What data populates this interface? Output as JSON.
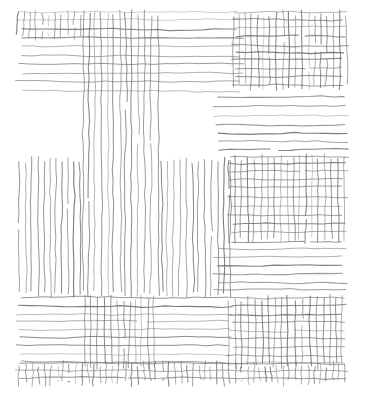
{
  "artwork": {
    "title": "Hatched Bands Drawing",
    "medium": "pen hatching",
    "canvas": {
      "width": 372,
      "height": 404,
      "background": "#ffffff"
    },
    "stroke": {
      "color": "#6f6f6f",
      "color_light": "#8d8d8d",
      "color_dark": "#5a5a5a",
      "width": 0.85,
      "jitter": 0.9
    },
    "composition": {
      "drawing_bounds": {
        "x": 16,
        "y": 11,
        "width": 332,
        "height": 374
      },
      "spacing": {
        "horizontal": 8.2,
        "vertical": 6.4
      }
    },
    "bands": [
      {
        "name": "top-horizontal-left-wide",
        "orientation": "horizontal",
        "x": 17,
        "y": 11,
        "width": 225,
        "height": 80,
        "density": 8.3,
        "tone": "#6f6f6f"
      },
      {
        "name": "top-horizontal-right-upper",
        "orientation": "horizontal",
        "x": 233,
        "y": 11,
        "width": 114,
        "height": 78,
        "density": 8.3,
        "tone": "#6f6f6f"
      },
      {
        "name": "top-vertical-left-strip",
        "orientation": "vertical",
        "x": 17,
        "y": 11,
        "width": 66,
        "height": 28,
        "density": 6.3,
        "tone": "#6f6f6f"
      },
      {
        "name": "top-vertical-center-column",
        "orientation": "vertical",
        "x": 83,
        "y": 11,
        "width": 77,
        "height": 285,
        "density": 6.1,
        "tone": "#6f6f6f"
      },
      {
        "name": "top-vertical-right-block",
        "orientation": "vertical",
        "x": 233,
        "y": 11,
        "width": 114,
        "height": 78,
        "density": 6.3,
        "tone": "#6f6f6f"
      },
      {
        "name": "upper-right-horizontal-band",
        "orientation": "horizontal",
        "x": 214,
        "y": 96,
        "width": 133,
        "height": 54,
        "density": 8.4,
        "tone": "#6f6f6f"
      },
      {
        "name": "mid-left-vertical-block",
        "orientation": "vertical",
        "x": 17,
        "y": 158,
        "width": 66,
        "height": 139,
        "density": 6.3,
        "tone": "#6f6f6f"
      },
      {
        "name": "mid-center-vertical-extension",
        "orientation": "vertical",
        "x": 160,
        "y": 158,
        "width": 72,
        "height": 139,
        "density": 6.3,
        "tone": "#6f6f6f"
      },
      {
        "name": "mid-right-horizontal-block",
        "orientation": "horizontal",
        "x": 228,
        "y": 155,
        "width": 119,
        "height": 88,
        "density": 8.2,
        "tone": "#6f6f6f"
      },
      {
        "name": "mid-right-vertical-block",
        "orientation": "vertical",
        "x": 228,
        "y": 155,
        "width": 119,
        "height": 88,
        "density": 6.4,
        "tone": "#6f6f6f"
      },
      {
        "name": "right-horizontal-band-lower",
        "orientation": "horizontal",
        "x": 214,
        "y": 248,
        "width": 133,
        "height": 46,
        "density": 8.4,
        "tone": "#6f6f6f"
      },
      {
        "name": "bottom-horizontal-left-band",
        "orientation": "horizontal",
        "x": 17,
        "y": 296,
        "width": 216,
        "height": 72,
        "density": 8.3,
        "tone": "#6f6f6f"
      },
      {
        "name": "bottom-vertical-center-block",
        "orientation": "vertical",
        "x": 83,
        "y": 296,
        "width": 77,
        "height": 72,
        "density": 6.3,
        "tone": "#6f6f6f"
      },
      {
        "name": "bottom-right-horizontal-block",
        "orientation": "horizontal",
        "x": 228,
        "y": 296,
        "width": 119,
        "height": 72,
        "density": 8.2,
        "tone": "#6f6f6f"
      },
      {
        "name": "bottom-right-vertical-block",
        "orientation": "vertical",
        "x": 228,
        "y": 296,
        "width": 119,
        "height": 72,
        "density": 6.4,
        "tone": "#6f6f6f"
      },
      {
        "name": "bottom-strip-horizontal",
        "orientation": "horizontal",
        "x": 17,
        "y": 362,
        "width": 330,
        "height": 23,
        "density": 7.0,
        "tone": "#6f6f6f"
      },
      {
        "name": "bottom-strip-vertical",
        "orientation": "vertical",
        "x": 17,
        "y": 362,
        "width": 330,
        "height": 23,
        "density": 6.2,
        "tone": "#6f6f6f"
      }
    ],
    "regions": [
      {
        "name": "top-left-crosshatch",
        "fill": "crosshatch"
      },
      {
        "name": "top-left-horizontal-only",
        "fill": "horizontal"
      },
      {
        "name": "top-center-crosshatch",
        "fill": "crosshatch"
      },
      {
        "name": "top-right-crosshatch",
        "fill": "crosshatch"
      },
      {
        "name": "center-vertical-column",
        "fill": "vertical"
      },
      {
        "name": "right-horizontal-band",
        "fill": "horizontal"
      },
      {
        "name": "mid-left-vertical",
        "fill": "vertical"
      },
      {
        "name": "mid-right-crosshatch",
        "fill": "crosshatch"
      },
      {
        "name": "bottom-left-horizontal",
        "fill": "horizontal"
      },
      {
        "name": "bottom-center-crosshatch",
        "fill": "crosshatch"
      },
      {
        "name": "bottom-right-crosshatch",
        "fill": "crosshatch"
      },
      {
        "name": "bottom-edge-crosshatch-strip",
        "fill": "crosshatch"
      },
      {
        "name": "blank-negative-space",
        "fill": "none"
      }
    ]
  }
}
